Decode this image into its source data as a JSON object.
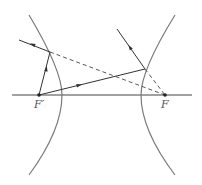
{
  "diagram": {
    "title": "",
    "labels": {
      "left_focus": "F′",
      "right_focus": "F"
    },
    "colors": {
      "line": "#444444",
      "curve": "#7a7a7a",
      "background": "#ffffff"
    },
    "elements": [
      {
        "type": "axis",
        "from": [
          12,
          95
        ],
        "to": [
          192,
          95
        ]
      },
      {
        "type": "hyperbola-branch",
        "side": "left"
      },
      {
        "type": "hyperbola-branch",
        "side": "right"
      },
      {
        "type": "ray",
        "from": "F′",
        "to": "left-branch-point",
        "style": "solid",
        "arrow": true
      },
      {
        "type": "ray",
        "from": "left-branch-point",
        "to": "out-left",
        "style": "solid",
        "arrow": true
      },
      {
        "type": "extension",
        "from": "left-branch-point",
        "to": "F",
        "style": "dashed"
      },
      {
        "type": "ray",
        "from": "F′",
        "to": "right-branch-point",
        "style": "solid",
        "arrow": true
      },
      {
        "type": "ray",
        "from": "right-branch-point",
        "to": "out-up-left",
        "style": "solid",
        "arrow": true
      },
      {
        "type": "extension",
        "from": "right-branch-point",
        "to": "F",
        "style": "dashed"
      }
    ]
  }
}
